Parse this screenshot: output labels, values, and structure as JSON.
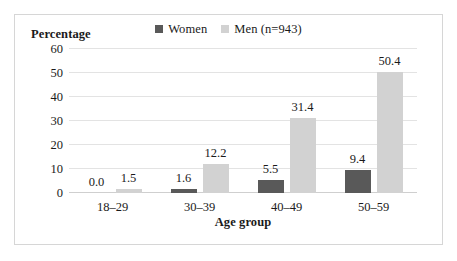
{
  "chart_data": {
    "type": "bar",
    "title": "",
    "xlabel": "Age group",
    "ylabel": "Percentage",
    "categories": [
      "18–29",
      "30–39",
      "40–49",
      "50–59"
    ],
    "series": [
      {
        "name": "Women",
        "color": "#595959",
        "values": [
          0.0,
          1.6,
          5.5,
          9.4
        ],
        "labels": [
          "0.0",
          "1.6",
          "5.5",
          "9.4"
        ]
      },
      {
        "name": "Men (n=943)",
        "color": "#d2d2d2",
        "values": [
          1.5,
          12.2,
          31.4,
          50.4
        ],
        "labels": [
          "1.5",
          "12.2",
          "31.4",
          "50.4"
        ]
      }
    ],
    "ylim": [
      0,
      60
    ],
    "yticks": [
      0,
      10,
      20,
      30,
      40,
      50,
      60
    ],
    "ytick_labels": [
      "0",
      "10",
      "20",
      "30",
      "40",
      "50",
      "60"
    ],
    "grid": "horizontal",
    "legend_position": "top-center",
    "data_labels": true
  },
  "legend": {
    "entries": [
      {
        "label": "Women",
        "color": "#595959"
      },
      {
        "label": "Men (n=943)",
        "color": "#d2d2d2"
      }
    ]
  },
  "axes": {
    "y_title": "Percentage",
    "x_title": "Age group"
  },
  "colors": {
    "women": "#595959",
    "men": "#d2d2d2",
    "gridline": "#e3e3e3",
    "border": "#d6d6d6",
    "text": "#1a1a1a"
  }
}
